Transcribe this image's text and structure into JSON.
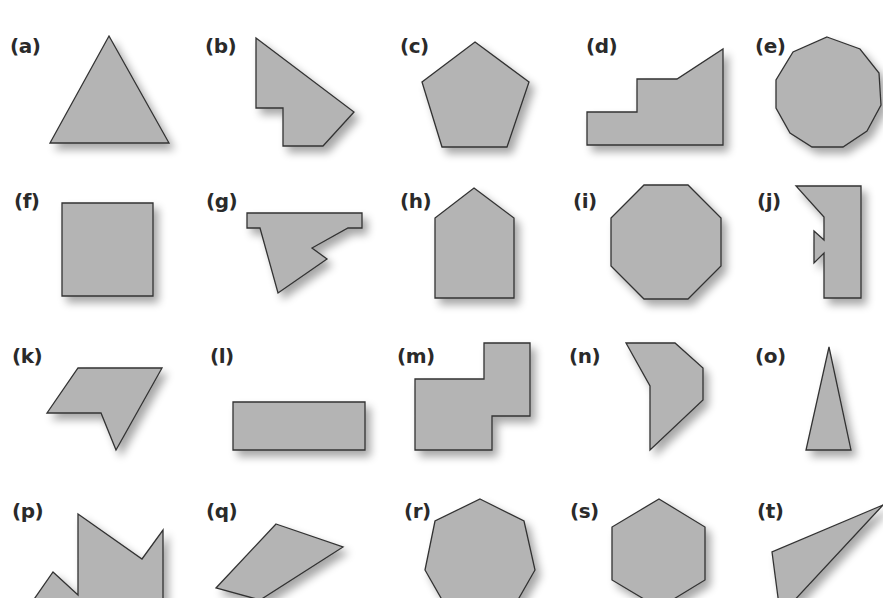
{
  "figure": {
    "fill_color": "#b4b4b4",
    "stroke_color": "#333333",
    "label_color": "#2a2a2a",
    "items": [
      {
        "label": "(a)",
        "name": "triangle",
        "label_pos": [
          10,
          36
        ],
        "points": "109,36 169,143 50,143"
      },
      {
        "label": "(b)",
        "name": "irregular-hexagon",
        "label_pos": [
          205,
          36
        ],
        "points": "256,38 354,112 323,146 283,146 283,108 256,108"
      },
      {
        "label": "(c)",
        "name": "pentagon",
        "label_pos": [
          400,
          36
        ],
        "points": "475,42 529,82 507,147 442,147 422,82"
      },
      {
        "label": "(d)",
        "name": "stepped-polygon",
        "label_pos": [
          586,
          36
        ],
        "points": "587,112 637,112 637,79 677,79 723,49 723,145 587,145"
      },
      {
        "label": "(e)",
        "name": "decagon",
        "label_pos": [
          755,
          36
        ],
        "points": "827,37 860,49 879,73 881,105 867,131 843,147 812,147 790,133 776,108 776,80 793,52"
      },
      {
        "label": "(f)",
        "name": "square",
        "label_pos": [
          14,
          191
        ],
        "points": "62,203 153,203 153,296 62,296"
      },
      {
        "label": "(g)",
        "name": "irregular-polygon",
        "label_pos": [
          206,
          191
        ],
        "points": "247,213 362,213 362,228 348,228 312,248 327,259 278,293 260,228 247,228"
      },
      {
        "label": "(h)",
        "name": "house-pentagon",
        "label_pos": [
          400,
          191
        ],
        "points": "474,188 514,218 514,298 435,298 435,218"
      },
      {
        "label": "(i)",
        "name": "octagon",
        "label_pos": [
          573,
          191
        ],
        "points": "644,185 688,185 721,218 721,266 688,299 644,299 611,266 611,218"
      },
      {
        "label": "(j)",
        "name": "notched-polygon",
        "label_pos": [
          757,
          191
        ],
        "points": "796,186 861,186 861,298 824,298 824,253 814,263 814,231 824,240 824,217"
      },
      {
        "label": "(k)",
        "name": "concave-pentagon",
        "label_pos": [
          12,
          346
        ],
        "points": "78,368 162,368 116,450 101,413 47,413"
      },
      {
        "label": "(l)",
        "name": "rectangle",
        "label_pos": [
          210,
          346
        ],
        "points": "233,402 365,402 365,450 233,450"
      },
      {
        "label": "(m)",
        "name": "l-shaped-polygon",
        "label_pos": [
          397,
          346
        ],
        "points": "484,343 530,343 530,416 492,416 492,450 415,450 415,379 484,379"
      },
      {
        "label": "(n)",
        "name": "irregular-pentagon",
        "label_pos": [
          569,
          346
        ],
        "points": "626,343 675,343 703,368 703,400 650,450 650,386"
      },
      {
        "label": "(o)",
        "name": "isosceles-triangle",
        "label_pos": [
          755,
          346
        ],
        "points": "829,347 851,450 806,450"
      },
      {
        "label": "(p)",
        "name": "jagged-polygon",
        "label_pos": [
          12,
          501
        ],
        "points": "78,514 142,559 163,530 163,605 30,605 53,572 78,595"
      },
      {
        "label": "(q)",
        "name": "quadrilateral",
        "label_pos": [
          206,
          501
        ],
        "points": "276,524 343,547 260,600 216,588"
      },
      {
        "label": "(r)",
        "name": "heptagon",
        "label_pos": [
          404,
          501
        ],
        "points": "480,499 524,521 535,570 515,605 445,605 425,570 435,521"
      },
      {
        "label": "(s)",
        "name": "hexagon",
        "label_pos": [
          570,
          501
        ],
        "points": "659,499 705,527 705,580 659,608 612,580 612,527"
      },
      {
        "label": "(t)",
        "name": "scalene-triangle",
        "label_pos": [
          757,
          501
        ],
        "points": "883,505 772,552 779,605 790,605"
      }
    ]
  }
}
